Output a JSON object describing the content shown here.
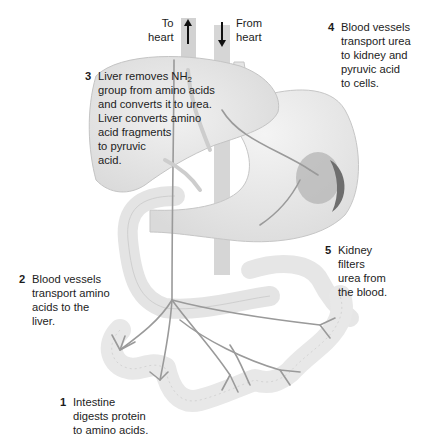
{
  "diagram": {
    "vessel_labels": {
      "to_heart": [
        "To",
        "heart"
      ],
      "from_heart": [
        "From",
        "heart"
      ]
    },
    "steps": [
      {
        "number": "1",
        "lines": [
          "Intestine",
          "digests protein",
          "to amino acids."
        ]
      },
      {
        "number": "2",
        "lines": [
          "Blood vessels",
          "transport amino",
          "acids to the",
          "liver."
        ]
      },
      {
        "number": "3",
        "lines_prefix": "Liver removes NH",
        "subscript": "2",
        "lines": [
          "group from amino acids",
          "and converts it to urea.",
          "Liver converts amino",
          "acid fragments",
          "to pyruvic",
          "acid."
        ]
      },
      {
        "number": "4",
        "lines": [
          "Blood vessels",
          "transport urea",
          "to kidney and",
          "pyruvic acid",
          "to cells."
        ]
      },
      {
        "number": "5",
        "lines": [
          "Kidney",
          "filters",
          "urea from",
          "the blood."
        ]
      }
    ],
    "organs": [
      "liver",
      "stomach",
      "kidney",
      "pancreas",
      "small-intestine",
      "blood-vessels"
    ],
    "colors": {
      "organ_fill": "#ebebeb",
      "organ_stroke": "#bdbdbd",
      "kidney_fill": "#a9a9a9",
      "kidney_dark": "#6e6e6e",
      "vessel_fill": "#d4d4d4",
      "arrow": "#111111",
      "text": "#1c1c1c"
    }
  }
}
